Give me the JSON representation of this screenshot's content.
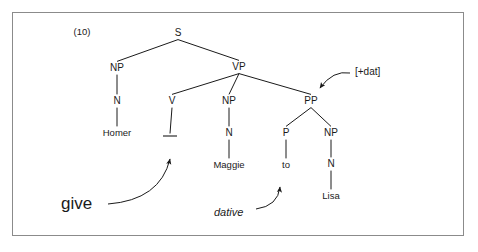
{
  "figure": {
    "example_number": "(10)",
    "frame": {
      "border_color": "#8b8b8b",
      "background": "#ffffff"
    },
    "ink_color": "#1a1a1a"
  },
  "tree": {
    "nodes": [
      {
        "id": "s",
        "label": "S",
        "x": 178,
        "y": 33,
        "kind": "category"
      },
      {
        "id": "np-subj",
        "label": "NP",
        "x": 117,
        "y": 68,
        "kind": "category"
      },
      {
        "id": "vp",
        "label": "VP",
        "x": 239,
        "y": 67,
        "kind": "category"
      },
      {
        "id": "n-subj",
        "label": "N",
        "x": 117,
        "y": 101,
        "kind": "category"
      },
      {
        "id": "v",
        "label": "V",
        "x": 172,
        "y": 101,
        "kind": "category"
      },
      {
        "id": "np-obj",
        "label": "NP",
        "x": 229,
        "y": 101,
        "kind": "category"
      },
      {
        "id": "pp",
        "label": "PP",
        "x": 311,
        "y": 101,
        "kind": "category"
      },
      {
        "id": "homer",
        "label": "Homer",
        "x": 117,
        "y": 133,
        "kind": "terminal"
      },
      {
        "id": "n-obj",
        "label": "N",
        "x": 229,
        "y": 133,
        "kind": "category"
      },
      {
        "id": "p",
        "label": "P",
        "x": 286,
        "y": 133,
        "kind": "category"
      },
      {
        "id": "np-iobj",
        "label": "NP",
        "x": 331,
        "y": 133,
        "kind": "category"
      },
      {
        "id": "maggie",
        "label": "Maggie",
        "x": 229,
        "y": 165,
        "kind": "terminal"
      },
      {
        "id": "to",
        "label": "to",
        "x": 286,
        "y": 165,
        "kind": "terminal"
      },
      {
        "id": "n-iobj",
        "label": "N",
        "x": 331,
        "y": 164,
        "kind": "category"
      },
      {
        "id": "lisa",
        "label": "Lisa",
        "x": 331,
        "y": 196,
        "kind": "terminal"
      }
    ],
    "trace": {
      "id": "v-trace",
      "x1": 163,
      "y1": 136,
      "x2": 177,
      "y2": 136
    },
    "edges": [
      {
        "from": "s",
        "to": "np-subj"
      },
      {
        "from": "s",
        "to": "vp"
      },
      {
        "from": "np-subj",
        "to": "n-subj"
      },
      {
        "from": "n-subj",
        "to": "homer"
      },
      {
        "from": "vp",
        "to": "v"
      },
      {
        "from": "vp",
        "to": "np-obj"
      },
      {
        "from": "vp",
        "to": "pp"
      },
      {
        "from": "v",
        "to": "v-trace"
      },
      {
        "from": "np-obj",
        "to": "n-obj"
      },
      {
        "from": "n-obj",
        "to": "maggie"
      },
      {
        "from": "pp",
        "to": "p"
      },
      {
        "from": "pp",
        "to": "np-iobj"
      },
      {
        "from": "p",
        "to": "to"
      },
      {
        "from": "np-iobj",
        "to": "n-iobj"
      },
      {
        "from": "n-iobj",
        "to": "lisa"
      }
    ]
  },
  "annotations": [
    {
      "id": "dat-feature",
      "text": "[+dat]",
      "style": "feature",
      "x": 355,
      "y": 72,
      "target": "pp",
      "arrow": {
        "start_x": 350,
        "start_y": 73,
        "ctrl_x": 333,
        "ctrl_y": 70,
        "end_x": 320,
        "end_y": 88
      }
    },
    {
      "id": "give-label",
      "text": "give",
      "style": "large",
      "x": 61,
      "y": 203,
      "target": "v-trace",
      "arrow": {
        "start_x": 108,
        "start_y": 204,
        "ctrl_x": 160,
        "ctrl_y": 200,
        "end_x": 170,
        "end_y": 159
      }
    },
    {
      "id": "dative-label",
      "text": "dative",
      "style": "italic",
      "x": 214,
      "y": 212,
      "target": "to",
      "arrow": {
        "start_x": 256,
        "start_y": 209,
        "ctrl_x": 278,
        "ctrl_y": 206,
        "end_x": 280,
        "end_y": 187
      }
    }
  ]
}
